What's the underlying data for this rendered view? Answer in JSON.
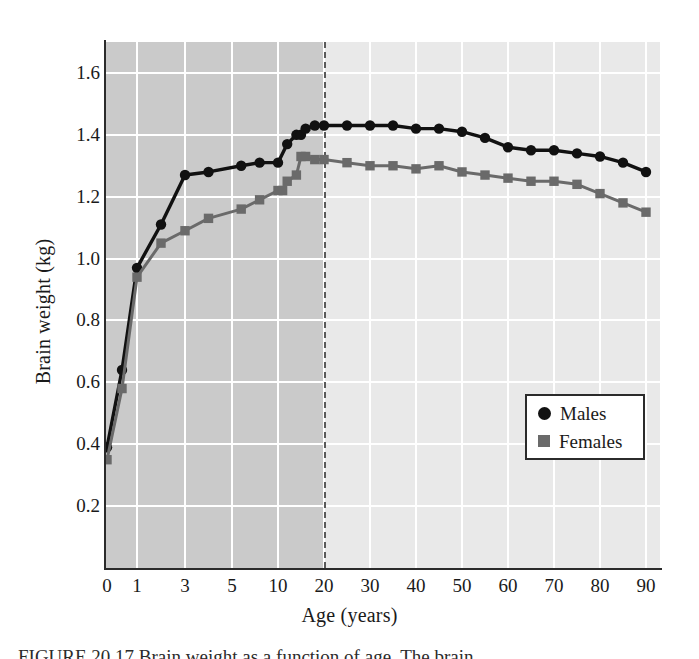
{
  "figure": {
    "caption": "FIGURE 20.17   Brain weight as a function of age. The brain",
    "caption_label": "FIGURE 20.17"
  },
  "legend": {
    "position": "inside-bottom-right",
    "entries": [
      {
        "label": "Males",
        "marker": "filled-circle",
        "color": "#111111"
      },
      {
        "label": "Females",
        "marker": "filled-square",
        "color": "#6a6a6a"
      }
    ]
  },
  "colors": {
    "males": "#111111",
    "females": "#6a6a6a",
    "plot_background_early": "#cacaca",
    "plot_background_late": "#e9e9e9",
    "gridline": "#ffffff",
    "axis": "#2b2b2b",
    "divider": "#5a5a5a"
  },
  "chart_data": {
    "type": "line",
    "title": "",
    "xlabel": "Age (years)",
    "ylabel": "Brain weight (kg)",
    "grid": true,
    "legend_position": "lower right",
    "x_scale": "nonlinear-compressed",
    "x_ticks": [
      0,
      1,
      3,
      5,
      10,
      20,
      30,
      40,
      50,
      60,
      70,
      80,
      90
    ],
    "x_tick_labels": [
      "0",
      "1",
      "3",
      "5",
      "10",
      "20",
      "30",
      "40",
      "50",
      "60",
      "70",
      "80",
      "90"
    ],
    "y_ticks": [
      0.2,
      0.4,
      0.6,
      0.8,
      1.0,
      1.2,
      1.4,
      1.6
    ],
    "y_tick_labels": [
      "0.2",
      "0.4",
      "0.6",
      "0.8",
      "1.0",
      "1.2",
      "1.4",
      "1.6"
    ],
    "ylim": [
      0.0,
      1.7
    ],
    "xlim": [
      0,
      90
    ],
    "annotations": [
      {
        "type": "vline",
        "x": 20,
        "style": "dashed",
        "note": "end of shaded growth region"
      },
      {
        "type": "shaded-region",
        "x_from": 0,
        "x_to": 20,
        "note": "darker background from birth to age 20"
      }
    ],
    "series": [
      {
        "name": "Males",
        "marker": "circle",
        "color": "#111111",
        "x": [
          0,
          0.5,
          1,
          2,
          3,
          4,
          6,
          8,
          10,
          12,
          14,
          15,
          16,
          18,
          20,
          25,
          30,
          35,
          40,
          45,
          50,
          55,
          60,
          65,
          70,
          75,
          80,
          85,
          90
        ],
        "y": [
          0.39,
          0.64,
          0.97,
          1.11,
          1.27,
          1.28,
          1.3,
          1.31,
          1.31,
          1.37,
          1.4,
          1.4,
          1.42,
          1.43,
          1.43,
          1.43,
          1.43,
          1.43,
          1.42,
          1.42,
          1.41,
          1.39,
          1.36,
          1.35,
          1.35,
          1.34,
          1.33,
          1.31,
          1.28
        ]
      },
      {
        "name": "Females",
        "marker": "square",
        "color": "#6a6a6a",
        "x": [
          0,
          0.5,
          1,
          2,
          3,
          4,
          6,
          8,
          10,
          11,
          12,
          14,
          15,
          16,
          18,
          20,
          25,
          30,
          35,
          40,
          45,
          50,
          55,
          60,
          65,
          70,
          75,
          80,
          85,
          90
        ],
        "y": [
          0.35,
          0.58,
          0.94,
          1.05,
          1.09,
          1.13,
          1.16,
          1.19,
          1.22,
          1.22,
          1.25,
          1.27,
          1.33,
          1.33,
          1.32,
          1.32,
          1.31,
          1.3,
          1.3,
          1.29,
          1.3,
          1.28,
          1.27,
          1.26,
          1.25,
          1.25,
          1.24,
          1.21,
          1.18,
          1.15
        ]
      }
    ]
  }
}
